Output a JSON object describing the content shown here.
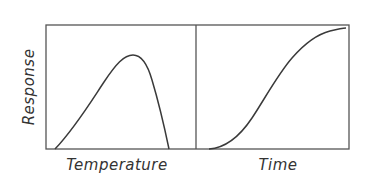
{
  "figure": {
    "ylabel": "Response",
    "panels": [
      {
        "id": "temperature",
        "xlabel": "Temperature",
        "curve": "bell-shaped (rises gradually, peaks, falls steeply)"
      },
      {
        "id": "time",
        "xlabel": "Time",
        "curve": "sigmoid (S-shaped, saturating)"
      }
    ],
    "colors": {
      "line": "#3a3a3a",
      "frame": "#555555",
      "text": "#333333",
      "background": "#ffffff"
    }
  }
}
